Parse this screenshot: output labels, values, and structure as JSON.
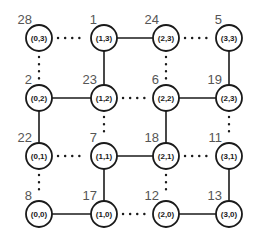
{
  "diagram": {
    "title": "",
    "nodes": [
      {
        "id": "n03",
        "col": 0,
        "row": 3,
        "text": "(0,3)",
        "label": "28"
      },
      {
        "id": "n13",
        "col": 1,
        "row": 3,
        "text": "(1,3)",
        "label": "1"
      },
      {
        "id": "n23",
        "col": 2,
        "row": 3,
        "text": "(2,3)",
        "label": "24"
      },
      {
        "id": "n33",
        "col": 3,
        "row": 3,
        "text": "(3,3)",
        "label": "5"
      },
      {
        "id": "n02",
        "col": 0,
        "row": 2,
        "text": "(0,2)",
        "label": "2"
      },
      {
        "id": "n12",
        "col": 1,
        "row": 2,
        "text": "(1,2)",
        "label": "23"
      },
      {
        "id": "n22",
        "col": 2,
        "row": 2,
        "text": "(2,2)",
        "label": "6"
      },
      {
        "id": "n32",
        "col": 3,
        "row": 2,
        "text": "(2,3)",
        "label": "19"
      },
      {
        "id": "n01",
        "col": 0,
        "row": 1,
        "text": "(0,1)",
        "label": "22"
      },
      {
        "id": "n11",
        "col": 1,
        "row": 1,
        "text": "(1,1)",
        "label": "7"
      },
      {
        "id": "n21",
        "col": 2,
        "row": 1,
        "text": "(2,1)",
        "label": "18"
      },
      {
        "id": "n31",
        "col": 3,
        "row": 1,
        "text": "(3,1)",
        "label": "11"
      },
      {
        "id": "n00",
        "col": 0,
        "row": 0,
        "text": "(0,0)",
        "label": "8"
      },
      {
        "id": "n10",
        "col": 1,
        "row": 0,
        "text": "(1,0)",
        "label": "17"
      },
      {
        "id": "n20",
        "col": 2,
        "row": 0,
        "text": "(2,0)",
        "label": "12"
      },
      {
        "id": "n30",
        "col": 3,
        "row": 0,
        "text": "(3,0)",
        "label": "13"
      }
    ],
    "edges": [
      {
        "from": "n03",
        "to": "n13",
        "style": "dotted"
      },
      {
        "from": "n13",
        "to": "n23",
        "style": "solid"
      },
      {
        "from": "n23",
        "to": "n33",
        "style": "dotted"
      },
      {
        "from": "n02",
        "to": "n12",
        "style": "solid"
      },
      {
        "from": "n12",
        "to": "n22",
        "style": "dotted"
      },
      {
        "from": "n22",
        "to": "n32",
        "style": "solid"
      },
      {
        "from": "n01",
        "to": "n11",
        "style": "dotted"
      },
      {
        "from": "n11",
        "to": "n21",
        "style": "solid"
      },
      {
        "from": "n21",
        "to": "n31",
        "style": "dotted"
      },
      {
        "from": "n00",
        "to": "n10",
        "style": "solid"
      },
      {
        "from": "n10",
        "to": "n20",
        "style": "dotted"
      },
      {
        "from": "n20",
        "to": "n30",
        "style": "solid"
      },
      {
        "from": "n03",
        "to": "n02",
        "style": "dotted"
      },
      {
        "from": "n02",
        "to": "n01",
        "style": "solid"
      },
      {
        "from": "n01",
        "to": "n00",
        "style": "dotted"
      },
      {
        "from": "n13",
        "to": "n12",
        "style": "solid"
      },
      {
        "from": "n12",
        "to": "n11",
        "style": "dotted"
      },
      {
        "from": "n11",
        "to": "n10",
        "style": "solid"
      },
      {
        "from": "n23",
        "to": "n22",
        "style": "dotted"
      },
      {
        "from": "n22",
        "to": "n21",
        "style": "solid"
      },
      {
        "from": "n21",
        "to": "n20",
        "style": "dotted"
      },
      {
        "from": "n33",
        "to": "n32",
        "style": "solid"
      },
      {
        "from": "n32",
        "to": "n31",
        "style": "dotted"
      },
      {
        "from": "n31",
        "to": "n30",
        "style": "solid"
      }
    ]
  }
}
